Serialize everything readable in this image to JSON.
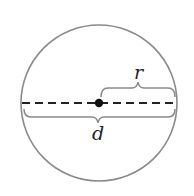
{
  "figure": {
    "labels": {
      "radius": "r",
      "diameter": "d"
    },
    "circle": {
      "cx": 99,
      "cy": 103,
      "r": 78,
      "stroke": "#8a8a8a"
    },
    "colors": {
      "line": "#222222",
      "brace": "#8a8a8a",
      "center": "#111111"
    }
  }
}
